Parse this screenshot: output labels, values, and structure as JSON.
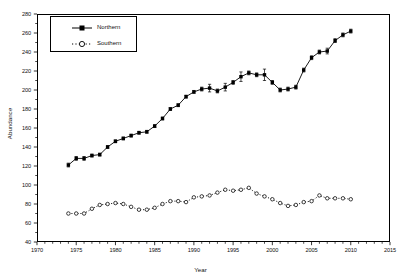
{
  "chart_data": {
    "type": "line",
    "title": "",
    "xlabel": "Year",
    "ylabel": "Abundance",
    "xlim": [
      1970,
      2015
    ],
    "ylim": [
      40,
      280
    ],
    "xticks": [
      1970,
      1975,
      1980,
      1985,
      1990,
      1995,
      2000,
      2005,
      2010,
      2015
    ],
    "yticks": [
      40,
      60,
      80,
      100,
      120,
      140,
      160,
      180,
      200,
      220,
      240,
      260,
      280
    ],
    "xtick_labels": [
      "1970",
      "1975",
      "1980",
      "1985",
      "1990",
      "1995",
      "2000",
      "2005",
      "2010",
      "2015"
    ],
    "ytick_labels": [
      "40",
      "60",
      "80",
      "100",
      "120",
      "140",
      "160",
      "180",
      "200",
      "220",
      "240",
      "260",
      "280"
    ],
    "grid": false,
    "legend_position": "upper-left-inside",
    "x": [
      1974,
      1975,
      1976,
      1977,
      1978,
      1979,
      1980,
      1981,
      1982,
      1983,
      1984,
      1985,
      1986,
      1987,
      1988,
      1989,
      1990,
      1991,
      1992,
      1993,
      1994,
      1995,
      1996,
      1997,
      1998,
      1999,
      2000,
      2001,
      2002,
      2003,
      2004,
      2005,
      2006,
      2007,
      2008,
      2009,
      2010
    ],
    "series": [
      {
        "name": "Northern",
        "marker": "filled-square",
        "line": "solid",
        "color": "#000000",
        "values": [
          121,
          128,
          128,
          131,
          132,
          140,
          146,
          149,
          152,
          155,
          156,
          162,
          170,
          180,
          184,
          193,
          198,
          201,
          202,
          199,
          203,
          208,
          214,
          218,
          216,
          216,
          208,
          200,
          201,
          203,
          221,
          234,
          240,
          241,
          252,
          258,
          262
        ],
        "errors": [
          2,
          2,
          2,
          1.5,
          1.5,
          1.5,
          1.5,
          1.5,
          1.5,
          1.5,
          1.5,
          1.5,
          1.5,
          1.5,
          1.5,
          1.5,
          1.5,
          2,
          4,
          2,
          4,
          2,
          5,
          2,
          2,
          6,
          2,
          2,
          2,
          2,
          2,
          2,
          2,
          3,
          2,
          2,
          2
        ]
      },
      {
        "name": "Southern",
        "marker": "open-circle",
        "line": "dotted",
        "color": "#000000",
        "values": [
          70,
          70,
          70,
          75,
          79,
          80,
          81,
          80,
          77,
          74,
          74,
          76,
          80,
          83,
          83,
          82,
          87,
          88,
          89,
          92,
          95,
          94,
          95,
          97,
          91,
          88,
          85,
          81,
          78,
          79,
          82,
          83,
          89,
          86,
          86,
          86,
          85
        ],
        "errors": [
          0,
          0,
          0,
          0,
          0,
          0,
          0,
          0,
          0,
          0,
          0,
          0,
          0,
          0,
          0,
          0,
          0,
          0,
          0,
          0,
          0,
          0,
          0,
          0,
          0,
          0,
          0,
          0,
          0,
          0,
          0,
          0,
          0,
          0,
          0,
          0,
          0
        ]
      }
    ]
  },
  "legend": {
    "items": [
      {
        "label": "Northern"
      },
      {
        "label": "Southern"
      }
    ]
  }
}
